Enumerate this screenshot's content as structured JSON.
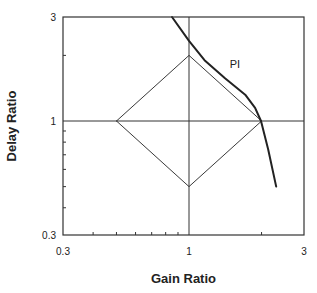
{
  "chart_data": {
    "type": "line",
    "title": "",
    "xlabel": "Gain Ratio",
    "ylabel": "Delay Ratio",
    "xscale": "log",
    "yscale": "log",
    "xlim": [
      0.3,
      3
    ],
    "ylim": [
      0.3,
      3
    ],
    "x_tick_labels": [
      "0.3",
      "1",
      "3"
    ],
    "y_tick_labels": [
      "0.3",
      "1",
      "3"
    ],
    "grid": false,
    "reference_lines": {
      "x": 1,
      "y": 1
    },
    "series": [
      {
        "name": "PI",
        "style": "thick-line",
        "points": [
          {
            "x": 0.85,
            "y": 3.0
          },
          {
            "x": 1.0,
            "y": 2.33
          },
          {
            "x": 1.16,
            "y": 1.9
          },
          {
            "x": 1.41,
            "y": 1.57
          },
          {
            "x": 1.71,
            "y": 1.32
          },
          {
            "x": 1.88,
            "y": 1.15
          },
          {
            "x": 1.99,
            "y": 1.0
          },
          {
            "x": 2.13,
            "y": 0.74
          },
          {
            "x": 2.3,
            "y": 0.5
          }
        ]
      },
      {
        "name": "diamond",
        "style": "thin-line",
        "points": [
          {
            "x": 0.5,
            "y": 1.0
          },
          {
            "x": 1.0,
            "y": 2.0
          },
          {
            "x": 2.0,
            "y": 1.0
          },
          {
            "x": 1.0,
            "y": 0.5
          },
          {
            "x": 0.5,
            "y": 1.0
          }
        ]
      }
    ],
    "annotations": [
      {
        "text": "PI",
        "x": 1.55,
        "y": 1.75
      }
    ]
  },
  "colors": {
    "line": "#222222",
    "frame": "#333333",
    "background": "#ffffff"
  }
}
